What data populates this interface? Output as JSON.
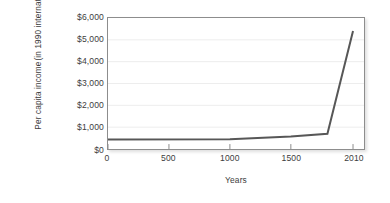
{
  "chart_data": {
    "type": "line",
    "title": "",
    "xlabel": "Years",
    "ylabel_line1": "Per capita income",
    "ylabel_line2": "(in 1990 international dollars)",
    "xlim": [
      0,
      2100
    ],
    "ylim": [
      0,
      6000
    ],
    "grid": true,
    "grid_axis": "y",
    "legend": "none",
    "x_ticks": [
      {
        "value": 0,
        "label": "0"
      },
      {
        "value": 500,
        "label": "500"
      },
      {
        "value": 1000,
        "label": "1000"
      },
      {
        "value": 1500,
        "label": "1500"
      },
      {
        "value": 2010,
        "label": "2010"
      }
    ],
    "y_ticks": [
      {
        "value": 0,
        "label": "$0"
      },
      {
        "value": 1000,
        "label": "$1,000"
      },
      {
        "value": 2000,
        "label": "$2,000"
      },
      {
        "value": 3000,
        "label": "$3,000"
      },
      {
        "value": 4000,
        "label": "$4,000"
      },
      {
        "value": 5000,
        "label": "$5,000"
      },
      {
        "value": 6000,
        "label": "$6,000"
      }
    ],
    "series": [
      {
        "name": "World per capita income",
        "color": "#575757",
        "x": [
          0,
          1000,
          1500,
          1800,
          2010
        ],
        "y": [
          430,
          450,
          570,
          700,
          5400
        ]
      }
    ]
  },
  "style": {
    "line_color": "#575757",
    "frame_color": "#8d8d8d",
    "grid_color": "#ededed",
    "text_color": "#3d3d3d",
    "background": "#ffffff"
  }
}
